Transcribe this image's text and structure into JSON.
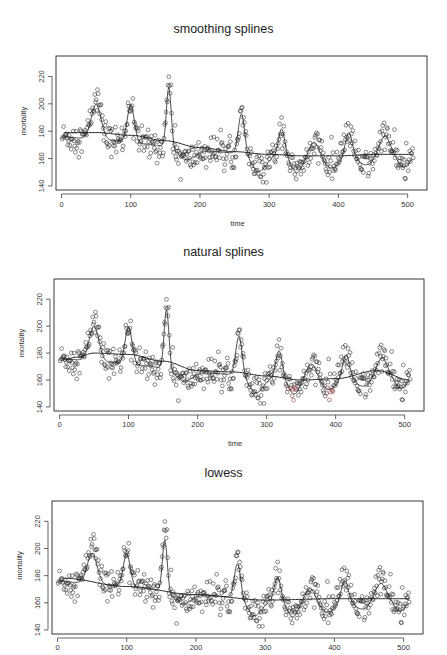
{
  "chart_data": [
    {
      "type": "scatter",
      "title": "smoothing splines",
      "xlabel": "time",
      "ylabel": "mortality",
      "xticks": [
        0,
        100,
        200,
        300,
        400,
        500
      ],
      "yticks": [
        140,
        160,
        180,
        200,
        220
      ],
      "xlim": [
        -8,
        528
      ],
      "ylim": [
        137,
        235
      ],
      "grid": false,
      "legend": "none",
      "series": [
        {
          "name": "observed mortality",
          "kind": "points",
          "note": "~508 weekly observations, seasonal peaks near t=50,100,155,260,318,365,415,465"
        },
        {
          "name": "smoothing spline fit (seasonal)",
          "kind": "line"
        },
        {
          "name": "smoothing spline trend",
          "kind": "line",
          "x": [
            5,
            50,
            100,
            150,
            200,
            250,
            300,
            350,
            400,
            450,
            508
          ],
          "y": [
            179,
            179,
            177,
            173,
            168,
            165,
            163,
            162,
            162,
            163,
            163
          ]
        }
      ]
    },
    {
      "type": "scatter",
      "title": "natural splines",
      "xlabel": "time",
      "ylabel": "mortality",
      "xticks": [
        0,
        100,
        200,
        300,
        400,
        500
      ],
      "yticks": [
        140,
        160,
        180,
        200,
        220
      ],
      "xlim": [
        -8,
        528
      ],
      "ylim": [
        137,
        235
      ],
      "grid": false,
      "legend": "none",
      "series": [
        {
          "name": "observed mortality",
          "kind": "points"
        },
        {
          "name": "natural spline fit (seasonal)",
          "kind": "line"
        },
        {
          "name": "natural spline trend",
          "kind": "line",
          "x": [
            5,
            25,
            50,
            100,
            150,
            200,
            250,
            300,
            350,
            400,
            460,
            508
          ],
          "y": [
            175,
            177,
            180,
            179,
            174,
            167,
            166,
            163,
            160,
            161,
            167,
            160
          ]
        }
      ]
    },
    {
      "type": "scatter",
      "title": "lowess",
      "xlabel": "",
      "ylabel": "mortality",
      "xticks": [
        0,
        100,
        200,
        300,
        400,
        500
      ],
      "yticks": [
        140,
        160,
        180,
        200,
        220
      ],
      "xlim": [
        -8,
        528
      ],
      "ylim": [
        137,
        235
      ],
      "grid": false,
      "legend": "none",
      "series": [
        {
          "name": "observed mortality",
          "kind": "points"
        },
        {
          "name": "lowess fit (seasonal)",
          "kind": "line",
          "peak_damping": 0.8
        },
        {
          "name": "lowess trend",
          "kind": "line",
          "x": [
            10,
            100,
            200,
            300,
            400,
            508
          ],
          "y": [
            178,
            172,
            166,
            162,
            163,
            163
          ]
        }
      ]
    }
  ],
  "seasonal_model": {
    "n": 508,
    "base_trend": {
      "x": [
        0,
        100,
        200,
        300,
        400,
        508
      ],
      "y": [
        176,
        172,
        166,
        162,
        161,
        162
      ]
    },
    "peaks": [
      {
        "t": 50,
        "height": 28,
        "width": 7
      },
      {
        "t": 100,
        "height": 30,
        "width": 5
      },
      {
        "t": 155,
        "height": 48,
        "width": 3.5
      },
      {
        "t": 260,
        "height": 32,
        "width": 4.5
      },
      {
        "t": 318,
        "height": 22,
        "width": 4.5
      },
      {
        "t": 365,
        "height": 12,
        "width": 7
      },
      {
        "t": 415,
        "height": 20,
        "width": 5
      },
      {
        "t": 467,
        "height": 16,
        "width": 8
      }
    ],
    "troughs": [
      {
        "t": 180,
        "depth": -8,
        "width": 12
      },
      {
        "t": 285,
        "depth": -12,
        "width": 10
      },
      {
        "t": 340,
        "depth": -12,
        "width": 8
      },
      {
        "t": 390,
        "depth": -8,
        "width": 10
      },
      {
        "t": 440,
        "depth": -6,
        "width": 10
      },
      {
        "t": 495,
        "depth": -8,
        "width": 8
      }
    ],
    "noise_sd": 6
  },
  "labels": {
    "title_1": "smoothing splines",
    "title_2": "natural splines",
    "title_3": "lowess",
    "time": "time",
    "mortality": "mortality"
  },
  "colors": {
    "ink": "#222222",
    "point": "#2b2b2b",
    "ylabel_panel2": "#3a7a4a",
    "accent_red_points": "#7a2a2a"
  }
}
